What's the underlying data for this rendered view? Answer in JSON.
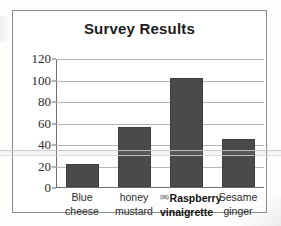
{
  "chart_data": {
    "type": "bar",
    "title": "Survey Results",
    "xlabel": "",
    "ylabel": "",
    "categories": [
      "Blue cheese",
      "honey mustard",
      "Raspberry vinaigrette",
      "Sesame ginger"
    ],
    "category_lines": [
      [
        "Blue",
        "cheese"
      ],
      [
        "honey",
        "mustard"
      ],
      [
        "Raspberry",
        "vinaigrette"
      ],
      [
        "Sesame",
        "ginger"
      ]
    ],
    "values": [
      21,
      56,
      101,
      45
    ],
    "ylim": [
      0,
      120
    ],
    "ytick_labels": [
      "0",
      "20",
      "40",
      "60",
      "80",
      "100",
      "120"
    ],
    "ytick_values": [
      0,
      20,
      40,
      60,
      80,
      100,
      120
    ],
    "grid": true,
    "legend": "none",
    "highlight_category_index": 2,
    "highlight_marker": "(96)",
    "colors": {
      "bar_fill": "#4a4a4a",
      "bar_stroke": "#3d3d3d",
      "gridline": "#b4b4b4",
      "axis": "#6e6e6e",
      "frame": "#8a8a8a",
      "title_text": "#1c1c1c",
      "tick_text": "#2a2a2a",
      "label_text": "#2b2b2b",
      "plot_background": "#ffffff",
      "page_background": "#fdfdfc"
    }
  }
}
